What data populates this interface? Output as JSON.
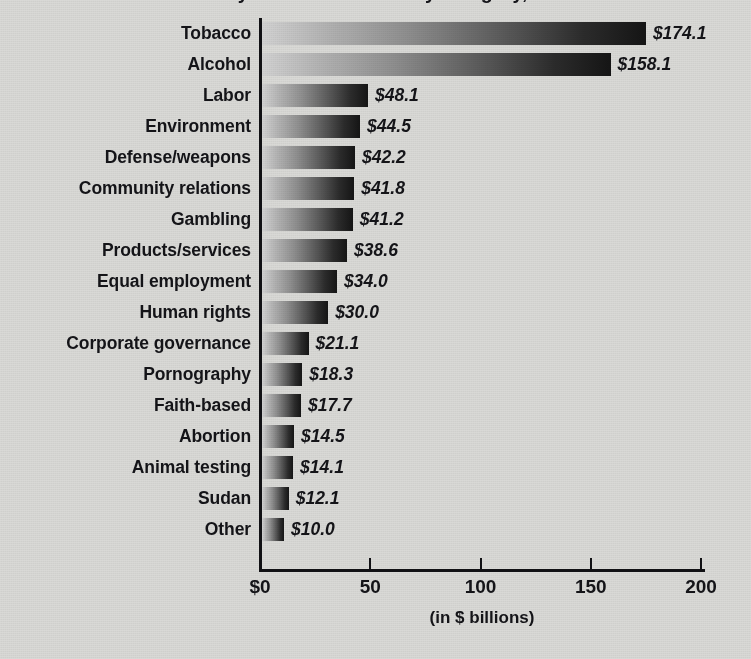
{
  "chart_data": {
    "type": "bar",
    "orientation": "horizontal",
    "title": "Socially screened assets by category, 2005",
    "xlabel": "(in $ billions)",
    "ylabel": "",
    "xlim": [
      0,
      200
    ],
    "xticks": [
      0,
      50,
      100,
      150,
      200
    ],
    "xtick_labels": [
      "$0",
      "50",
      "100",
      "150",
      "200"
    ],
    "grid": false,
    "legend": null,
    "value_label_prefix": "$",
    "categories": [
      "Tobacco",
      "Alcohol",
      "Labor",
      "Environment",
      "Defense/weapons",
      "Community relations",
      "Gambling",
      "Products/services",
      "Equal employment",
      "Human rights",
      "Corporate governance",
      "Pornography",
      "Faith-based",
      "Abortion",
      "Animal testing",
      "Sudan",
      "Other"
    ],
    "values": [
      174.1,
      158.1,
      48.1,
      44.5,
      42.2,
      41.8,
      41.2,
      38.6,
      34.0,
      30.0,
      21.1,
      18.3,
      17.7,
      14.5,
      14.1,
      12.1,
      10.0
    ],
    "value_labels": [
      "$174.1",
      "$158.1",
      "$48.1",
      "$44.5",
      "$42.2",
      "$41.8",
      "$41.2",
      "$38.6",
      "$34.0",
      "$30.0",
      "$21.1",
      "$18.3",
      "$17.7",
      "$14.5",
      "$14.1",
      "$12.1",
      "$10.0"
    ],
    "bar_gradient": {
      "from": "#d2d2d2",
      "to": "#151515"
    },
    "axis_color": "#111114",
    "text_color": "#141418",
    "background_color": "#d9d9d6"
  }
}
